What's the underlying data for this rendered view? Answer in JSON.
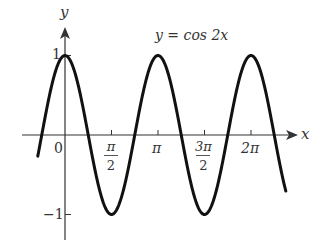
{
  "chart_data": {
    "type": "line",
    "title": "y = cos 2x",
    "xlabel": "x",
    "ylabel": "y",
    "function": "cos(2x)",
    "x_range": [
      -0.92,
      7.46
    ],
    "ylim": [
      -1,
      1
    ],
    "grid": false,
    "legend": null,
    "x_ticks": [
      {
        "value": 0,
        "label": "0"
      },
      {
        "value": 1.5708,
        "label": "π/2",
        "num": "π",
        "den": "2"
      },
      {
        "value": 3.1416,
        "label": "π"
      },
      {
        "value": 4.7124,
        "label": "3π/2",
        "num": "3π",
        "den": "2"
      },
      {
        "value": 6.2832,
        "label": "2π"
      }
    ],
    "y_ticks": [
      {
        "value": 1,
        "label": "1"
      },
      {
        "value": -1,
        "label": "−1"
      }
    ],
    "key_points": [
      {
        "x": 0,
        "y": 1
      },
      {
        "x": 0.7854,
        "y": 0
      },
      {
        "x": 1.5708,
        "y": -1
      },
      {
        "x": 2.3562,
        "y": 0
      },
      {
        "x": 3.1416,
        "y": 1
      },
      {
        "x": 3.927,
        "y": 0
      },
      {
        "x": 4.7124,
        "y": -1
      },
      {
        "x": 5.4978,
        "y": 0
      },
      {
        "x": 6.2832,
        "y": 1
      }
    ],
    "colors": {
      "curve": "#111111",
      "axis": "#333333",
      "text": "#333333"
    }
  },
  "labels": {
    "equation": "y = cos 2x",
    "x_axis": "x",
    "y_axis": "y",
    "tick_0": "0",
    "tick_pi_half_num": "π",
    "tick_pi_half_den": "2",
    "tick_pi": "π",
    "tick_3pi_half_num": "3π",
    "tick_3pi_half_den": "2",
    "tick_2pi": "2π",
    "y_one": "1",
    "y_neg_one": "−1"
  }
}
